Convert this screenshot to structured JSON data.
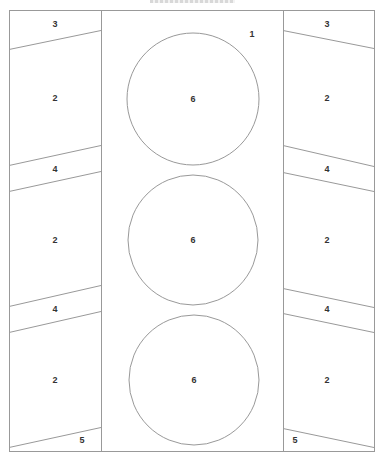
{
  "diagram": {
    "stroke_color": "#999999",
    "label_color": "#333333",
    "outer": {
      "x": 9,
      "y": 10,
      "w": 365,
      "h": 441
    },
    "columns": {
      "left": {
        "x1": 9,
        "x2": 101
      },
      "center": {
        "x1": 101,
        "x2": 283
      },
      "right": {
        "x1": 283,
        "x2": 374
      }
    },
    "slanted_lines": [
      {
        "side": "left",
        "x1": 9,
        "y1": 49,
        "x2": 101,
        "y2": 30
      },
      {
        "side": "left",
        "x1": 9,
        "y1": 165,
        "x2": 101,
        "y2": 145
      },
      {
        "side": "left",
        "x1": 9,
        "y1": 191,
        "x2": 101,
        "y2": 171
      },
      {
        "side": "left",
        "x1": 9,
        "y1": 306,
        "x2": 101,
        "y2": 285
      },
      {
        "side": "left",
        "x1": 9,
        "y1": 332,
        "x2": 101,
        "y2": 311
      },
      {
        "side": "left",
        "x1": 9,
        "y1": 447,
        "x2": 101,
        "y2": 427
      },
      {
        "side": "right",
        "x1": 283,
        "y1": 30,
        "x2": 374,
        "y2": 48
      },
      {
        "side": "right",
        "x1": 283,
        "y1": 145,
        "x2": 374,
        "y2": 166
      },
      {
        "side": "right",
        "x1": 283,
        "y1": 172,
        "x2": 374,
        "y2": 191
      },
      {
        "side": "right",
        "x1": 283,
        "y1": 288,
        "x2": 374,
        "y2": 307
      },
      {
        "side": "right",
        "x1": 283,
        "y1": 313,
        "x2": 374,
        "y2": 332
      },
      {
        "side": "right",
        "x1": 283,
        "y1": 428,
        "x2": 374,
        "y2": 447
      }
    ],
    "circles": [
      {
        "cx": 193,
        "cy": 99,
        "r": 66,
        "label": "6"
      },
      {
        "cx": 193,
        "cy": 240,
        "r": 65,
        "label": "6"
      },
      {
        "cx": 194,
        "cy": 380,
        "r": 65,
        "label": "6"
      }
    ],
    "labels": [
      {
        "text": "3",
        "x": 55,
        "y": 24
      },
      {
        "text": "3",
        "x": 327,
        "y": 24
      },
      {
        "text": "1",
        "x": 252,
        "y": 34
      },
      {
        "text": "2",
        "x": 55,
        "y": 98
      },
      {
        "text": "2",
        "x": 327,
        "y": 98
      },
      {
        "text": "4",
        "x": 55,
        "y": 169
      },
      {
        "text": "4",
        "x": 327,
        "y": 169
      },
      {
        "text": "2",
        "x": 55,
        "y": 240
      },
      {
        "text": "2",
        "x": 327,
        "y": 240
      },
      {
        "text": "4",
        "x": 55,
        "y": 309
      },
      {
        "text": "4",
        "x": 327,
        "y": 309
      },
      {
        "text": "2",
        "x": 55,
        "y": 380
      },
      {
        "text": "2",
        "x": 327,
        "y": 380
      },
      {
        "text": "5",
        "x": 82,
        "y": 440
      },
      {
        "text": "5",
        "x": 295,
        "y": 440
      },
      {
        "text": "6",
        "x": 193,
        "y": 99
      },
      {
        "text": "6",
        "x": 193,
        "y": 240
      },
      {
        "text": "6",
        "x": 194,
        "y": 380
      }
    ]
  }
}
